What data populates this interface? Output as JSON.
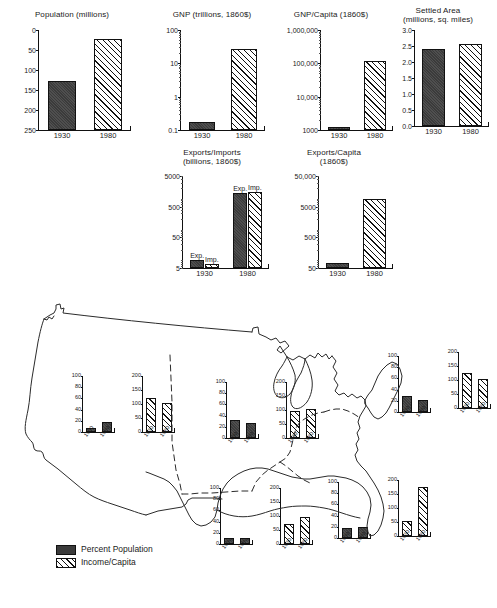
{
  "figure": {
    "years": [
      "1930",
      "1980"
    ]
  },
  "legend": {
    "items": [
      {
        "label": "Percent Population",
        "swatch": "dark"
      },
      {
        "label": "Income/Capita",
        "swatch": "hatch"
      }
    ]
  },
  "chart_data": [
    {
      "id": "population",
      "type": "bar",
      "title": "Population (millions)",
      "xlabel": "",
      "ylabel": "",
      "scale": "linear",
      "ylim": [
        0,
        250
      ],
      "yticks": [
        "0",
        "50",
        "100",
        "150",
        "200",
        "250"
      ],
      "categories": [
        "1930",
        "1980"
      ],
      "values": [
        122,
        227
      ],
      "styles": [
        "dark",
        "hatch"
      ]
    },
    {
      "id": "gnp",
      "type": "bar",
      "title": "GNP (trillions, 1860$)",
      "xlabel": "",
      "ylabel": "",
      "scale": "log",
      "ylim": [
        0.1,
        100
      ],
      "yticks": [
        "100",
        "10",
        "1",
        "0.1"
      ],
      "categories": [
        "1930",
        "1980"
      ],
      "values": [
        0.18,
        27
      ],
      "styles": [
        "dark",
        "hatch"
      ]
    },
    {
      "id": "gnp-capita",
      "type": "bar",
      "title": "GNP/Capita (1860$)",
      "xlabel": "",
      "ylabel": "",
      "scale": "log",
      "ylim": [
        1000,
        1000000
      ],
      "yticks": [
        "1,000,000",
        "100,000",
        "10,000",
        "1000"
      ],
      "categories": [
        "1930",
        "1980"
      ],
      "values": [
        1250,
        120000
      ],
      "styles": [
        "dark",
        "hatch"
      ]
    },
    {
      "id": "settled-area",
      "type": "bar",
      "title": "Settled Area\n(millions, sq. miles)",
      "xlabel": "",
      "ylabel": "",
      "scale": "linear",
      "ylim": [
        0,
        3.0
      ],
      "yticks": [
        "3.0",
        "2.5",
        "2.0",
        "1.5",
        "1.0",
        "0.5",
        "0.0"
      ],
      "categories": [
        "1930",
        "1980"
      ],
      "values": [
        2.42,
        2.55
      ],
      "styles": [
        "dark",
        "hatch"
      ]
    },
    {
      "id": "exports-imports",
      "type": "bar",
      "title": "Exports/Imports\n(billions, 1860$)",
      "xlabel": "",
      "ylabel": "",
      "scale": "log",
      "ylim": [
        5,
        5000
      ],
      "yticks": [
        "5000",
        "500",
        "50",
        "5"
      ],
      "categories": [
        "1930",
        "1980"
      ],
      "series": [
        {
          "name": "Exp.",
          "style": "dark",
          "values": [
            9,
            1400
          ]
        },
        {
          "name": "Imp.",
          "style": "hatch",
          "values": [
            7,
            1500
          ]
        }
      ],
      "bar_labels": [
        "Exp.",
        "Imp."
      ]
    },
    {
      "id": "exports-capita",
      "type": "bar",
      "title": "Exports/Capita\n(1860$)",
      "xlabel": "",
      "ylabel": "",
      "scale": "log",
      "ylim": [
        50,
        50000
      ],
      "yticks": [
        "50,000",
        "5000",
        "500",
        "50"
      ],
      "categories": [
        "1930",
        "1980"
      ],
      "values": [
        75,
        9000
      ],
      "styles": [
        "dark",
        "hatch"
      ]
    },
    {
      "id": "west-percent-population",
      "type": "bar",
      "region": "West",
      "title": "",
      "scale": "linear",
      "ylim": [
        0,
        100
      ],
      "yticks": [
        "100",
        "80",
        "60",
        "40",
        "20",
        "0"
      ],
      "categories": [
        "1930",
        "1980"
      ],
      "values": [
        8,
        18
      ],
      "styles": [
        "dark",
        "dark"
      ]
    },
    {
      "id": "west-income-capita",
      "type": "bar",
      "region": "West",
      "title": "",
      "scale": "linear",
      "ylim": [
        0,
        200
      ],
      "yticks": [
        "200",
        "150",
        "100",
        "50",
        "0"
      ],
      "categories": [
        "1930",
        "1980"
      ],
      "values": [
        120,
        105
      ],
      "styles": [
        "hatch",
        "hatch"
      ]
    },
    {
      "id": "midwest-percent-population",
      "type": "bar",
      "region": "Midwest",
      "title": "",
      "scale": "linear",
      "ylim": [
        0,
        100
      ],
      "yticks": [
        "100",
        "80",
        "60",
        "40",
        "20",
        "0"
      ],
      "categories": [
        "1930",
        "1980"
      ],
      "values": [
        33,
        26
      ],
      "styles": [
        "dark",
        "dark"
      ]
    },
    {
      "id": "midwest-income-capita",
      "type": "bar",
      "region": "Midwest",
      "title": "",
      "scale": "linear",
      "ylim": [
        0,
        200
      ],
      "yticks": [
        "200",
        "150",
        "100",
        "50",
        "0"
      ],
      "categories": [
        "1930",
        "1980"
      ],
      "values": [
        98,
        103
      ],
      "styles": [
        "hatch",
        "hatch"
      ]
    },
    {
      "id": "northeast-percent-population",
      "type": "bar",
      "region": "Northeast",
      "title": "",
      "scale": "linear",
      "ylim": [
        0,
        100
      ],
      "yticks": [
        "100",
        "80",
        "60",
        "40",
        "20",
        "0"
      ],
      "categories": [
        "1930",
        "1980"
      ],
      "values": [
        28,
        22
      ],
      "styles": [
        "dark",
        "dark"
      ]
    },
    {
      "id": "northeast-income-capita",
      "type": "bar",
      "region": "Northeast",
      "title": "",
      "scale": "linear",
      "ylim": [
        0,
        200
      ],
      "yticks": [
        "200",
        "150",
        "100",
        "50",
        "0"
      ],
      "categories": [
        "1930",
        "1980"
      ],
      "values": [
        125,
        105
      ],
      "styles": [
        "hatch",
        "hatch"
      ]
    },
    {
      "id": "southcentral-percent-population",
      "type": "bar",
      "region": "South Central",
      "title": "",
      "scale": "linear",
      "ylim": [
        0,
        100
      ],
      "yticks": [
        "100",
        "80",
        "60",
        "40",
        "20",
        "0"
      ],
      "categories": [
        "1930",
        "1980"
      ],
      "values": [
        10,
        11
      ],
      "styles": [
        "dark",
        "dark"
      ]
    },
    {
      "id": "southcentral-income-capita",
      "type": "bar",
      "region": "South Central",
      "title": "",
      "scale": "linear",
      "ylim": [
        0,
        200
      ],
      "yticks": [
        "200",
        "150",
        "100",
        "50",
        "0"
      ],
      "categories": [
        "1930",
        "1980"
      ],
      "values": [
        70,
        95
      ],
      "styles": [
        "hatch",
        "hatch"
      ]
    },
    {
      "id": "southeast-percent-population",
      "type": "bar",
      "region": "Southeast",
      "title": "",
      "scale": "linear",
      "ylim": [
        0,
        100
      ],
      "yticks": [
        "100",
        "80",
        "60",
        "40",
        "20",
        "0"
      ],
      "categories": [
        "1930",
        "1980"
      ],
      "values": [
        18,
        19
      ],
      "styles": [
        "dark",
        "dark"
      ]
    },
    {
      "id": "southeast-income-capita",
      "type": "bar",
      "region": "Southeast",
      "title": "",
      "scale": "linear",
      "ylim": [
        0,
        200
      ],
      "yticks": [
        "200",
        "150",
        "100",
        "50",
        "0"
      ],
      "categories": [
        "1930",
        "1980"
      ],
      "values": [
        55,
        175
      ],
      "styles": [
        "hatch",
        "hatch"
      ]
    }
  ]
}
